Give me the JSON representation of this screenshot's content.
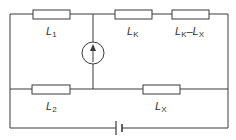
{
  "diagram": {
    "type": "circuit",
    "components": {
      "L1": {
        "symbol": "L",
        "sub": "1",
        "kind": "resistor"
      },
      "LK": {
        "symbol": "L",
        "sub": "K",
        "kind": "resistor"
      },
      "LKLX": {
        "symbol": "L",
        "sub": "K",
        "dash": "–",
        "symbol2": "L",
        "sub2": "X",
        "kind": "resistor"
      },
      "L2": {
        "symbol": "L",
        "sub": "2",
        "kind": "resistor"
      },
      "LX": {
        "symbol": "L",
        "sub": "X",
        "kind": "resistor"
      },
      "source": {
        "kind": "current-source",
        "direction": "up"
      },
      "battery": {
        "kind": "dc-voltage-source"
      }
    },
    "colors": {
      "line": "#3a3a3a",
      "text": "#333333",
      "background": "#ffffff"
    }
  }
}
